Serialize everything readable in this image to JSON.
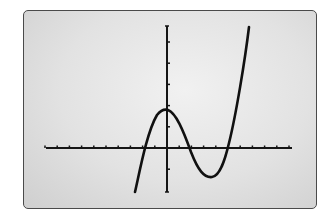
{
  "screen": {
    "background": "#e4e4e4",
    "border_color": "#4a4a4a",
    "curve_color": "#111111",
    "axis_color": "#151515"
  },
  "chart_data": {
    "type": "line",
    "title": "",
    "xlabel": "",
    "ylabel": "",
    "grid": false,
    "legend": null,
    "axes": {
      "x_ticks": [
        -10,
        -9,
        -8,
        -7,
        -6,
        -5,
        -4,
        -3,
        -2,
        -1,
        1,
        2,
        3,
        4,
        5,
        6,
        7,
        8,
        9,
        10
      ],
      "y_ticks": [
        -2,
        -1,
        1,
        2,
        3,
        4,
        5
      ],
      "xlim": [
        -10,
        10
      ],
      "ylim": [
        -2,
        6
      ]
    },
    "series": [
      {
        "name": "cubic",
        "description": "Cubic polynomial with roots near x=-2, x=2, x=5; local max near (0,1.8), local min near (4,-1.4)",
        "x": [
          -2.6,
          -2.0,
          -1.0,
          0.0,
          1.0,
          2.0,
          3.0,
          4.0,
          5.0,
          6.0,
          6.9
        ],
        "y": [
          -2.1,
          0.0,
          1.4,
          1.8,
          1.3,
          0.0,
          -1.0,
          -1.4,
          0.0,
          2.4,
          5.8
        ]
      }
    ]
  }
}
